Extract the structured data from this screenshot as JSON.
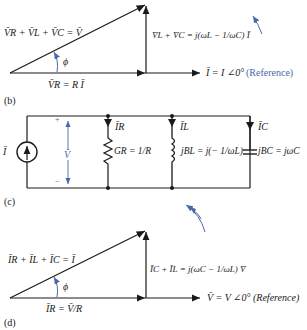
{
  "panel_b": {
    "caption": "(b)",
    "hyp_label": "V̄R + V̄L + V̄C = V̄",
    "base_label": "V̄R = R Ī",
    "vert_label": "V̄L + V̄C = j(ωL − 1/ωC) Ī",
    "ref_label": "Ī = I ∠0°",
    "ref_note": "(Reference)",
    "angle": "ϕ"
  },
  "panel_c": {
    "caption": "(c)",
    "source_label": "Ī",
    "voltage_label": "V̄",
    "plus": "+",
    "minus": "−",
    "ir_label": "ĪR",
    "il_label": "ĪL",
    "ic_label": "ĪC",
    "gr_label": "GR = 1/R",
    "bl_label": "jBL = j(− 1/ωL)",
    "bc_label": "jBC = jωC"
  },
  "panel_d": {
    "caption": "(d)",
    "hyp_label": "ĪR + ĪL + ĪC = Ī",
    "base_label": "ĪR = V̄/R",
    "vert_label": "ĪC + ĪL = j(ωC − 1/ωL) V̄",
    "ref_label": "V̄ = V ∠0° (Reference)",
    "angle": "ϕ"
  },
  "colors": {
    "ink": "#1a1a1a",
    "accent": "#4a68a8"
  }
}
